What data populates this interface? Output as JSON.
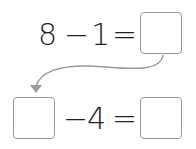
{
  "equation1": {
    "a": "8",
    "op": "−",
    "b": "1",
    "eq": "=",
    "answer": ""
  },
  "equation2": {
    "a": "",
    "op": "−",
    "b": "4",
    "eq": "=",
    "answer": ""
  },
  "arrow": {
    "color": "#9a9a9a",
    "from": "equation1.answer",
    "to": "equation2.a"
  }
}
